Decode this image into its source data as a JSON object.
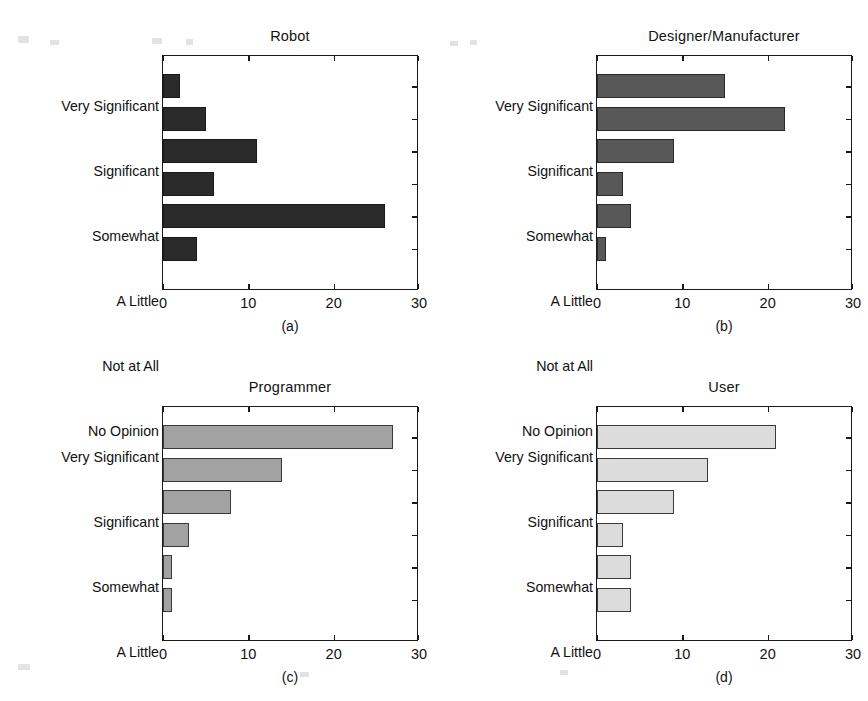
{
  "figure": {
    "background": "#ffffff",
    "width": 868,
    "height": 701
  },
  "chart_data": [
    {
      "type": "bar",
      "orientation": "horizontal",
      "panel": "a",
      "title": "Robot",
      "caption": "(a)",
      "categories": [
        "Very Significant",
        "Significant",
        "Somewhat",
        "A Little",
        "Not at All",
        "No Opinion"
      ],
      "values": [
        2,
        5,
        11,
        6,
        26,
        4
      ],
      "xlabel": "",
      "ylabel": "",
      "xlim": [
        0,
        30
      ],
      "xticks": [
        0,
        10,
        20,
        30
      ],
      "xticklabels": [
        "0",
        "10",
        "20",
        "30"
      ],
      "grid": false,
      "legend": "none",
      "bar_fill": "#2b2b2b",
      "bar_stroke": "#1a1a1a"
    },
    {
      "type": "bar",
      "orientation": "horizontal",
      "panel": "b",
      "title": "Designer/Manufacturer",
      "caption": "(b)",
      "categories": [
        "Very Significant",
        "Significant",
        "Somewhat",
        "A Little",
        "Not at All",
        "No Opinion"
      ],
      "values": [
        15,
        22,
        9,
        3,
        4,
        1
      ],
      "xlabel": "",
      "ylabel": "",
      "xlim": [
        0,
        30
      ],
      "xticks": [
        0,
        10,
        20,
        30
      ],
      "xticklabels": [
        "0",
        "10",
        "20",
        "30"
      ],
      "grid": false,
      "legend": "none",
      "bar_fill": "#585858",
      "bar_stroke": "#2a2a2a"
    },
    {
      "type": "bar",
      "orientation": "horizontal",
      "panel": "c",
      "title": "Programmer",
      "caption": "(c)",
      "categories": [
        "Very Significant",
        "Significant",
        "Somewhat",
        "A Little",
        "Not at All",
        "No Opinion"
      ],
      "values": [
        27,
        14,
        8,
        3,
        1,
        1
      ],
      "xlabel": "",
      "ylabel": "",
      "xlim": [
        0,
        30
      ],
      "xticks": [
        0,
        10,
        20,
        30
      ],
      "xticklabels": [
        "0",
        "10",
        "20",
        "30"
      ],
      "grid": false,
      "legend": "none",
      "bar_fill": "#a2a2a2",
      "bar_stroke": "#3a3a3a"
    },
    {
      "type": "bar",
      "orientation": "horizontal",
      "panel": "d",
      "title": "User",
      "caption": "(d)",
      "categories": [
        "Very Significant",
        "Significant",
        "Somewhat",
        "A Little",
        "Not at All",
        "No Opinion"
      ],
      "values": [
        21,
        13,
        9,
        3,
        4,
        4
      ],
      "xlabel": "",
      "ylabel": "",
      "xlim": [
        0,
        30
      ],
      "xticks": [
        0,
        10,
        20,
        30
      ],
      "xticklabels": [
        "0",
        "10",
        "20",
        "30"
      ],
      "grid": false,
      "legend": "none",
      "bar_fill": "#dcdcdc",
      "bar_stroke": "#3a3a3a"
    }
  ]
}
